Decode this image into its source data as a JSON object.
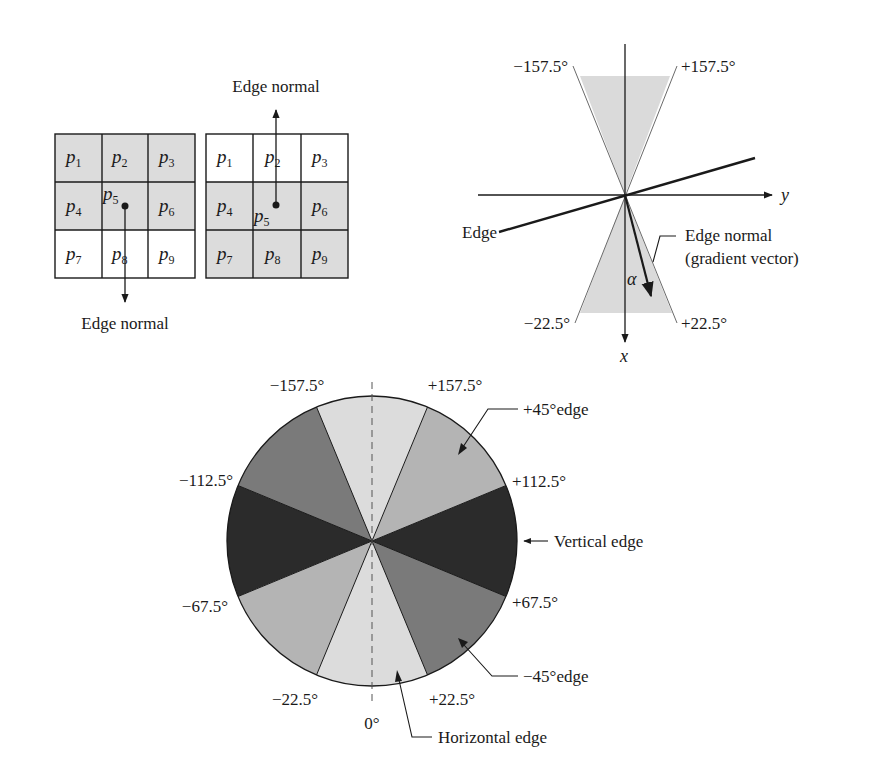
{
  "figure": {
    "colors": {
      "ink": "#1a1a1a",
      "cell_shade": "#dcdcdc",
      "wedge_shade": "#dadada",
      "sector_light": "#dcdcdc",
      "sector_plus45": "#b4b4b4",
      "sector_minus45": "#7a7a7a",
      "sector_vertical": "#2b2b2b"
    },
    "grid_left": {
      "cells": [
        {
          "base": "p",
          "sub": "1",
          "shaded": true
        },
        {
          "base": "p",
          "sub": "2",
          "shaded": true
        },
        {
          "base": "p",
          "sub": "3",
          "shaded": true
        },
        {
          "base": "p",
          "sub": "4",
          "shaded": true
        },
        {
          "base": "p",
          "sub": "5",
          "shaded": true
        },
        {
          "base": "p",
          "sub": "6",
          "shaded": true
        },
        {
          "base": "p",
          "sub": "7",
          "shaded": false
        },
        {
          "base": "p",
          "sub": "8",
          "shaded": false
        },
        {
          "base": "p",
          "sub": "9",
          "shaded": false
        }
      ],
      "arrow_label": "Edge normal",
      "arrow_direction": "down"
    },
    "grid_right": {
      "cells": [
        {
          "base": "p",
          "sub": "1",
          "shaded": false
        },
        {
          "base": "p",
          "sub": "2",
          "shaded": false
        },
        {
          "base": "p",
          "sub": "3",
          "shaded": false
        },
        {
          "base": "p",
          "sub": "4",
          "shaded": true
        },
        {
          "base": "p",
          "sub": "5",
          "shaded": true
        },
        {
          "base": "p",
          "sub": "6",
          "shaded": true
        },
        {
          "base": "p",
          "sub": "7",
          "shaded": true
        },
        {
          "base": "p",
          "sub": "8",
          "shaded": true
        },
        {
          "base": "p",
          "sub": "9",
          "shaded": true
        }
      ],
      "arrow_label": "Edge normal",
      "arrow_direction": "up"
    },
    "axes_diagram": {
      "angle_labels": {
        "top_left": "−157.5°",
        "top_right": "+157.5°",
        "bottom_left": "−22.5°",
        "bottom_right": "+22.5°"
      },
      "y_axis_label": "y",
      "x_axis_label": "x",
      "edge_label": "Edge",
      "normal_label_line1": "Edge normal",
      "normal_label_line2": "(gradient vector)",
      "alpha_label": "α"
    },
    "sector_circle": {
      "angle_labels": {
        "m157": "−157.5°",
        "p157": "+157.5°",
        "m112": "−112.5°",
        "p112": "+112.5°",
        "m67": "−67.5°",
        "p67": "+67.5°",
        "m22": "−22.5°",
        "p22": "+22.5°",
        "zero": "0°"
      },
      "callouts": {
        "plus45": "+45°edge",
        "vertical": "Vertical edge",
        "minus45": "−45°edge",
        "horizontal": "Horizontal edge"
      },
      "sectors": [
        {
          "from": -22.5,
          "to": 22.5,
          "class": "horizontal"
        },
        {
          "from": 22.5,
          "to": 67.5,
          "class": "minus45"
        },
        {
          "from": 67.5,
          "to": 112.5,
          "class": "vertical"
        },
        {
          "from": 112.5,
          "to": 157.5,
          "class": "plus45"
        },
        {
          "from": 157.5,
          "to": 202.5,
          "class": "horizontal"
        },
        {
          "from": -157.5,
          "to": -112.5,
          "class": "minus45"
        },
        {
          "from": -112.5,
          "to": -67.5,
          "class": "vertical"
        },
        {
          "from": -67.5,
          "to": -22.5,
          "class": "plus45"
        }
      ]
    }
  }
}
